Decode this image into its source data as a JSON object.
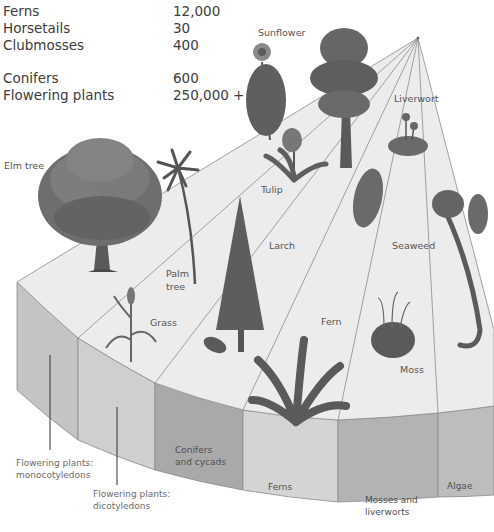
{
  "species_counts": [
    {
      "group": "Ferns",
      "count": "12,000"
    },
    {
      "group": "Horsetails",
      "count": "30"
    },
    {
      "group": "Clubmosses",
      "count": "400"
    },
    {
      "group": "Conifers",
      "count": "600"
    },
    {
      "group": "Flowering plants",
      "count": "250,000 +"
    }
  ],
  "plant_labels": {
    "elm": "Elm tree",
    "palm_line1": "Palm",
    "palm_line2": "tree",
    "grass": "Grass",
    "sunflower": "Sunflower",
    "tulip": "Tulip",
    "larch": "Larch",
    "fern": "Fern",
    "liverwort": "Liverwort",
    "seaweed": "Seaweed",
    "moss": "Moss"
  },
  "segments": [
    {
      "id": "monocots",
      "line1": "Flowering plants:",
      "line2": "monocotyledons",
      "color": "#c4c4c4"
    },
    {
      "id": "dicots",
      "line1": "Flowering plants:",
      "line2": "dicotyledons",
      "color": "#cfcfcf"
    },
    {
      "id": "conifers",
      "line1": "Conifers",
      "line2": "and cycads",
      "color": "#a9a9a9"
    },
    {
      "id": "ferns",
      "line1": "Ferns",
      "line2": "",
      "color": "#d4d4d4"
    },
    {
      "id": "mosses",
      "line1": "Mosses and",
      "line2": "liverworts",
      "color": "#b3b3b3"
    },
    {
      "id": "algae",
      "line1": "Algae",
      "line2": "",
      "color": "#bdbdbd"
    }
  ],
  "colors": {
    "top_face": "#ececec",
    "edge_line": "#8c8c8c",
    "plant_dark": "#4f4f4f",
    "plant_mid": "#777777"
  }
}
